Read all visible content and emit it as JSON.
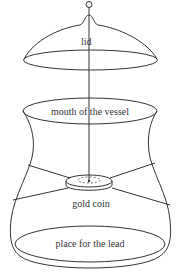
{
  "diagram": {
    "labels": {
      "lid": "lid",
      "mouth": "mouth of the vessel",
      "coin": "gold coin",
      "lead": "place for the lead"
    },
    "colors": {
      "stroke": "#333333",
      "background": "#ffffff"
    }
  }
}
